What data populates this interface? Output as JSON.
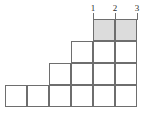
{
  "figure": {
    "kind": "staircase-grid-diagram",
    "width": 144,
    "height": 114,
    "background_color": "#ffffff",
    "line_color": "#6e6e6e",
    "shaded_cell_color": "#dcdcdc",
    "label_color": "#2b2b2b"
  },
  "column_labels": [
    {
      "text": "1",
      "x": 87,
      "y": 4
    },
    {
      "text": "2",
      "x": 109,
      "y": 4
    },
    {
      "text": "3",
      "x": 131,
      "y": 4
    }
  ],
  "label_ticks": [
    {
      "x": 93,
      "y": 13,
      "height": 7
    },
    {
      "x": 115,
      "y": 13,
      "height": 7
    },
    {
      "x": 137,
      "y": 13,
      "height": 7
    }
  ],
  "rows": [
    {
      "index": 1,
      "name": "top-row",
      "y": 19,
      "height": 22,
      "cells": [
        {
          "x": 93,
          "width": 22,
          "shaded": true
        },
        {
          "x": 115,
          "width": 22,
          "shaded": true
        }
      ]
    },
    {
      "index": 2,
      "name": "second-row",
      "y": 41,
      "height": 22,
      "cells": [
        {
          "x": 71,
          "width": 22,
          "shaded": false
        },
        {
          "x": 93,
          "width": 22,
          "shaded": false
        },
        {
          "x": 115,
          "width": 22,
          "shaded": false
        }
      ]
    },
    {
      "index": 3,
      "name": "third-row",
      "y": 63,
      "height": 22,
      "cells": [
        {
          "x": 49,
          "width": 22,
          "shaded": false
        },
        {
          "x": 71,
          "width": 22,
          "shaded": false
        },
        {
          "x": 93,
          "width": 22,
          "shaded": false
        },
        {
          "x": 115,
          "width": 22,
          "shaded": false
        }
      ]
    },
    {
      "index": 4,
      "name": "bottom-row",
      "y": 85,
      "height": 22,
      "cells": [
        {
          "x": 5,
          "width": 22,
          "shaded": false
        },
        {
          "x": 27,
          "width": 22,
          "shaded": false
        },
        {
          "x": 49,
          "width": 22,
          "shaded": false
        },
        {
          "x": 71,
          "width": 22,
          "shaded": false
        },
        {
          "x": 93,
          "width": 22,
          "shaded": false
        },
        {
          "x": 115,
          "width": 22,
          "shaded": false
        }
      ]
    }
  ]
}
